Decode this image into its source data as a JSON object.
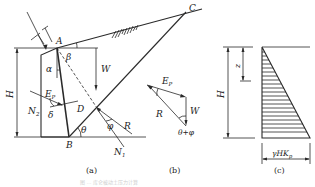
{
  "figure": {
    "panel_a": {
      "caption": "(a)",
      "points": {
        "A": "A",
        "B": "B",
        "C": "C",
        "D": "D"
      },
      "angles": {
        "alpha": "α",
        "beta": "β",
        "theta": "θ",
        "phi": "φ",
        "delta": "δ"
      },
      "forces": {
        "W": "W",
        "R": "R",
        "Ep": "E",
        "Ep_sub": "P",
        "N1": "N",
        "N1_sub": "1",
        "N2": "N",
        "N2_sub": "2"
      },
      "dimension_H": "H"
    },
    "panel_b": {
      "caption": "(b)",
      "forces": {
        "Ep": "E",
        "Ep_sub": "P",
        "W": "W",
        "R": "R"
      },
      "angle_label": "θ+φ"
    },
    "panel_c": {
      "caption": "(c)",
      "dimension_H": "H",
      "dimension_z": "z",
      "base_label": "γHK",
      "base_label_sub": "p"
    },
    "figure_caption": "图 … 库仑被动土压力计算"
  }
}
